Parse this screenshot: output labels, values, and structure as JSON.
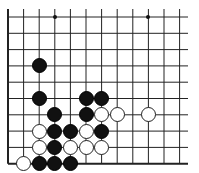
{
  "board": {
    "columns": 12,
    "rows": 10,
    "origin": {
      "x": 8,
      "y": 17
    },
    "spacing": {
      "x": 15.6,
      "y": 16.3
    },
    "right_edge_x": 188,
    "line_color": "#222222",
    "left_edge_thick": true,
    "bottom_edge_thick": true
  },
  "star_points": [
    [
      3,
      0
    ],
    [
      9,
      0
    ]
  ],
  "stones": {
    "black": [
      [
        2,
        3
      ],
      [
        2,
        5
      ],
      [
        5,
        5
      ],
      [
        6,
        5
      ],
      [
        3,
        6
      ],
      [
        5,
        6
      ],
      [
        3,
        7
      ],
      [
        4,
        7
      ],
      [
        6,
        7
      ],
      [
        3,
        8
      ],
      [
        2,
        9
      ],
      [
        3,
        9
      ],
      [
        4,
        9
      ]
    ],
    "white": [
      [
        6,
        6
      ],
      [
        7,
        6
      ],
      [
        9,
        6
      ],
      [
        2,
        7
      ],
      [
        5,
        7
      ],
      [
        2,
        8
      ],
      [
        4,
        8
      ],
      [
        5,
        8
      ],
      [
        6,
        8
      ],
      [
        1,
        9
      ]
    ]
  }
}
